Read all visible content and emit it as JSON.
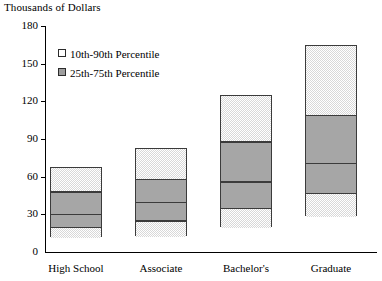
{
  "chart_data": {
    "type": "bar",
    "chart_style": "percentile-range-box",
    "title": "Thousands of Dollars",
    "ylabel": "Thousands of Dollars",
    "xlabel": "",
    "ylim": [
      0,
      180
    ],
    "yticks": [
      0,
      30,
      60,
      90,
      120,
      150,
      180
    ],
    "ytick_labels": [
      "0",
      "30",
      "60",
      "90",
      "120",
      "150",
      "180"
    ],
    "grid": false,
    "legend_position": "upper-left-inside",
    "categories": [
      "High School",
      "Associate",
      "Bachelor's",
      "Graduate"
    ],
    "legend": [
      {
        "label": "10th-90th Percentile",
        "swatch": "light-checker",
        "color": "#d8d8d8"
      },
      {
        "label": "25th-75th Percentile",
        "swatch": "solid-gray",
        "color": "#a6a6a6"
      }
    ],
    "series": [
      {
        "name": "10th Percentile",
        "values": [
          12,
          13,
          20,
          29
        ]
      },
      {
        "name": "25th Percentile",
        "values": [
          21,
          26,
          36,
          48
        ]
      },
      {
        "name": "Median",
        "values": [
          31,
          41,
          57,
          72
        ]
      },
      {
        "name": "75th Percentile",
        "values": [
          49,
          59,
          89,
          110
        ]
      },
      {
        "name": "90th Percentile",
        "values": [
          68,
          83,
          125,
          165
        ]
      }
    ],
    "bars": [
      {
        "category": "High School",
        "p10": 12,
        "p25": 21,
        "median": 31,
        "p75": 49,
        "p90": 68
      },
      {
        "category": "Associate",
        "p10": 13,
        "p25": 26,
        "median": 41,
        "p75": 59,
        "p90": 83
      },
      {
        "category": "Bachelor's",
        "p10": 20,
        "p25": 36,
        "median": 57,
        "p75": 89,
        "p90": 125
      },
      {
        "category": "Graduate",
        "p10": 29,
        "p25": 48,
        "median": 72,
        "p75": 110,
        "p90": 165
      }
    ],
    "colors": {
      "outer_fill": "#d8d8d8",
      "inner_fill": "#a6a6a6",
      "border": "#3b3b3b",
      "axis": "#000000"
    }
  }
}
